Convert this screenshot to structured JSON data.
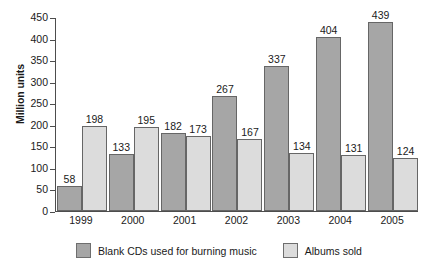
{
  "chart_data": {
    "type": "bar",
    "title": "",
    "xlabel": "",
    "ylabel": "Million units",
    "ylim": [
      0,
      450
    ],
    "yticks": [
      0,
      50,
      100,
      150,
      200,
      250,
      300,
      350,
      400,
      450
    ],
    "ytick_labels": [
      "0",
      "50",
      "100",
      "150",
      "200",
      "250",
      "300",
      "350",
      "400",
      "450"
    ],
    "grid": false,
    "legend_position": "bottom-center",
    "categories": [
      "1999",
      "2000",
      "2001",
      "2002",
      "2003",
      "2004",
      "2005"
    ],
    "series": [
      {
        "name": "Blank CDs used for burning music",
        "color": "#a6a6a6",
        "values": [
          58,
          133,
          182,
          267,
          337,
          404,
          439
        ],
        "value_labels": [
          "58",
          "133",
          "182",
          "267",
          "337",
          "404",
          "439"
        ]
      },
      {
        "name": "Albums sold",
        "color": "#dcdcdc",
        "values": [
          198,
          195,
          173,
          167,
          134,
          131,
          124
        ],
        "value_labels": [
          "198",
          "195",
          "173",
          "167",
          "134",
          "131",
          "124"
        ]
      }
    ]
  },
  "legend": {
    "items": [
      {
        "label": "Blank CDs used for burning music",
        "swatch": "s0"
      },
      {
        "label": "Albums sold",
        "swatch": "s1"
      }
    ]
  }
}
